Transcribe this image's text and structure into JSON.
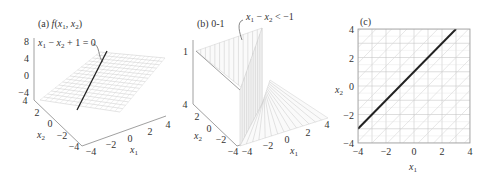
{
  "chart_data": [
    {
      "type": "surface",
      "panel": "a",
      "title": "(a) f(x₁, x₂)",
      "title_parts": {
        "prefix": "(a) ",
        "f": "f",
        "open": "(",
        "x1": "x",
        "s1": "1",
        "comma": ", ",
        "x2": "x",
        "s2": "2",
        "close": ")"
      },
      "function": "f(x1, x2) = x1 - x2 + 1 (plane)",
      "annotation": "x₁ − x₂ + 1 = 0",
      "annotation_parts": {
        "x1": "x",
        "s1": "1",
        "op1": " − ",
        "x2": "x",
        "s2": "2",
        "rest": " + 1 = 0"
      },
      "xlabel": "x₁",
      "ylabel": "x₂",
      "xlabel_parts": {
        "v": "x",
        "s": "1"
      },
      "ylabel_parts": {
        "v": "x",
        "s": "2"
      },
      "xlim": [
        -4,
        4
      ],
      "ylim": [
        -4,
        4
      ],
      "zlim": [
        -4,
        8
      ],
      "x_ticks": [
        "−4",
        "−2",
        "0",
        "2",
        "4"
      ],
      "y_ticks": [
        "4",
        "2",
        "0",
        "−2",
        "−4"
      ],
      "z_ticks": [
        "8",
        "4",
        "0",
        "−4"
      ]
    },
    {
      "type": "surface",
      "panel": "b",
      "title": "(b) 0-1",
      "function": "indicator: 1 if x1 - x2 < -1 else 0",
      "annotation": "x₁ − x₂ < −1",
      "annotation_parts": {
        "x1": "x",
        "s1": "1",
        "op1": " − ",
        "x2": "x",
        "s2": "2",
        "rest": " < −1"
      },
      "xlabel": "x₁",
      "ylabel": "x₂",
      "xlabel_parts": {
        "v": "x",
        "s": "1"
      },
      "ylabel_parts": {
        "v": "x",
        "s": "2"
      },
      "xlim": [
        -4,
        4
      ],
      "ylim": [
        -4,
        4
      ],
      "zlim": [
        0,
        1
      ],
      "x_ticks": [
        "−4",
        "−2",
        "0",
        "2",
        "4"
      ],
      "y_ticks": [
        "4",
        "2",
        "0",
        "−2",
        "−4"
      ],
      "z_ticks": [
        "1"
      ]
    },
    {
      "type": "line",
      "panel": "c",
      "title": "(c)",
      "xlabel": "x₁",
      "ylabel": "x₂",
      "xlabel_parts": {
        "v": "x",
        "s": "1"
      },
      "ylabel_parts": {
        "v": "x",
        "s": "2"
      },
      "xlim": [
        -4,
        4
      ],
      "ylim": [
        -4,
        4
      ],
      "x_ticks": [
        -4,
        -2,
        0,
        2,
        4
      ],
      "y_ticks": [
        -4,
        -2,
        0,
        2,
        4
      ],
      "x_tick_labels": [
        "−4",
        "−2",
        "0",
        "2",
        "4"
      ],
      "y_tick_labels": [
        "−4",
        "−2",
        "0",
        "2",
        "4"
      ],
      "grid": true,
      "series": [
        {
          "name": "decision boundary x₂ = x₁ + 1",
          "x": [
            -4,
            3
          ],
          "y": [
            -3,
            4
          ],
          "color": "#222222"
        }
      ],
      "hatched_regions": [
        "upper-left (x₁ − x₂ < −1)",
        "lower-right"
      ]
    }
  ]
}
